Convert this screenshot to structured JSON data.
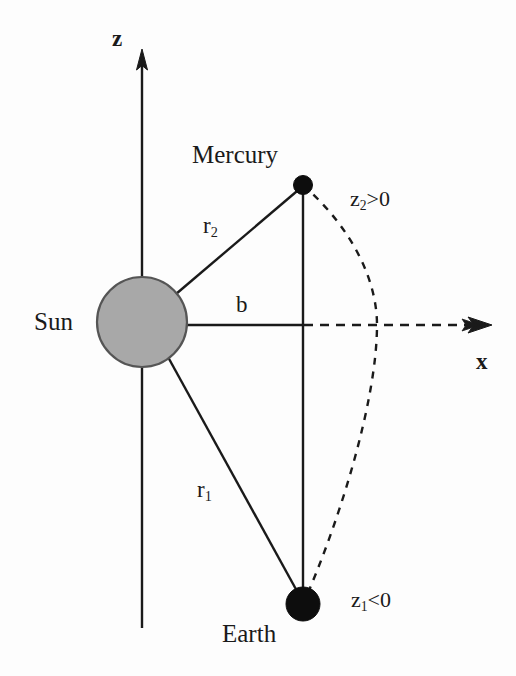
{
  "figure": {
    "background_color": "#fdfdfd",
    "stroke_color": "#1a1a1a",
    "sun_fill_color": "#a8a8a8",
    "body_fill_color": "#0d0d0d"
  },
  "axes": {
    "z": {
      "label": "z",
      "label_x": 112,
      "label_y": 27,
      "line_x": 142,
      "arrow_tip_y": 50,
      "line_bottom_y": 628,
      "direction": "up"
    },
    "x": {
      "label": "x",
      "label_x": 476,
      "label_y": 350,
      "line_y": 325,
      "solid_start_x": 142,
      "solid_end_x": 303,
      "dashed_end_x": 490,
      "direction": "right"
    }
  },
  "bodies": [
    {
      "name": "Sun",
      "label": "Sun",
      "label_x": 34,
      "label_y": 309,
      "cx": 142,
      "cy": 322,
      "r": 45,
      "fill": "#a8a8a8",
      "stroke": "#4a4a4a"
    },
    {
      "name": "Mercury",
      "label": "Mercury",
      "label_x": 192,
      "label_y": 142,
      "cx": 303,
      "cy": 185,
      "r": 9,
      "fill": "#0d0d0d",
      "stroke": "#0d0d0d"
    },
    {
      "name": "Earth",
      "label": "Earth",
      "label_x": 222,
      "label_y": 621,
      "cx": 303,
      "cy": 604,
      "r": 17,
      "fill": "#0d0d0d",
      "stroke": "#0d0d0d"
    }
  ],
  "segments": {
    "r2": {
      "label": "r",
      "subscript": "2",
      "label_x": 203,
      "label_y": 214,
      "from": "Sun",
      "to": "Mercury",
      "x1": 178,
      "y1": 295,
      "x2": 303,
      "y2": 185
    },
    "r1": {
      "label": "r",
      "subscript": "1",
      "label_x": 197,
      "label_y": 478,
      "from": "Sun",
      "to": "Earth",
      "x1": 170,
      "y1": 358,
      "x2": 303,
      "y2": 604
    },
    "b": {
      "label": "b",
      "label_x": 236,
      "label_y": 293,
      "from": "Sun",
      "to": "impact-parameter-foot",
      "x1": 142,
      "y1": 325,
      "x2": 303,
      "y2": 325
    },
    "chord": {
      "label": "",
      "x1": 303,
      "y1": 185,
      "x2": 303,
      "y2": 604
    }
  },
  "annotations": [
    {
      "id": "z2-positive",
      "base": "z",
      "subscript": "2",
      "relation": ">0",
      "text": "z2>0",
      "x": 350,
      "y": 188
    },
    {
      "id": "z1-negative",
      "base": "z",
      "subscript": "1",
      "relation": "<0",
      "text": "z1<0",
      "x": 351,
      "y": 589
    }
  ],
  "curve": {
    "name": "light-ray-path",
    "style": "dashed",
    "start_x": 303,
    "start_y": 185,
    "end_x": 303,
    "end_y": 604,
    "max_bulge_x": 377,
    "max_bulge_y": 325,
    "dash_pattern": "7,7"
  }
}
